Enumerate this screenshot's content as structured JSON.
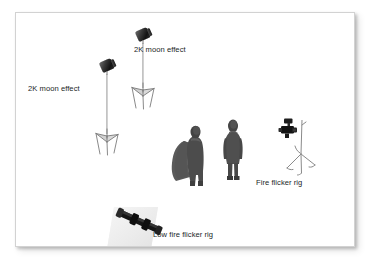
{
  "diagram": {
    "background_color": "#ffffff",
    "frame_border_color": "#d2d2d2",
    "fixture_color": "#1a1a1a",
    "stand_color": "#8d8d8d",
    "figure_color": "#4d4d4d",
    "label_color": "#221f1f"
  },
  "labels": [
    {
      "id": "label-2k-moon-effect-left",
      "text": "2K moon effect",
      "x": 12,
      "y": 71
    },
    {
      "id": "label-2k-moon-effect-right",
      "text": "2K moon effect",
      "x": 118,
      "y": 32
    },
    {
      "id": "label-fire-flicker-rig",
      "text": "Fire flicker rig",
      "x": 240,
      "y": 165
    },
    {
      "id": "label-low-fire-flicker-rig",
      "text": "Low fire flicker rig",
      "x": 137,
      "y": 217
    }
  ],
  "fixtures": [
    {
      "id": "light-stand-left",
      "name": "2K moon effect light stand",
      "type": "light-stand",
      "x": 78,
      "y": 47,
      "height": 95
    },
    {
      "id": "light-stand-right",
      "name": "2K moon effect light stand",
      "type": "light-stand",
      "x": 114,
      "y": 16,
      "height": 78
    },
    {
      "id": "fire-flicker-rig",
      "name": "Fire flicker rig",
      "type": "c-stand-rig",
      "x": 262,
      "y": 105
    },
    {
      "id": "low-fire-flicker-rig",
      "name": "Low fire flicker rig",
      "type": "floor-tube",
      "x": 96,
      "y": 192
    }
  ],
  "subjects": [
    {
      "id": "figure-caped",
      "name": "Standing figure with cape",
      "x": 152,
      "y": 112
    },
    {
      "id": "figure-standing",
      "name": "Standing figure",
      "x": 202,
      "y": 106
    }
  ]
}
